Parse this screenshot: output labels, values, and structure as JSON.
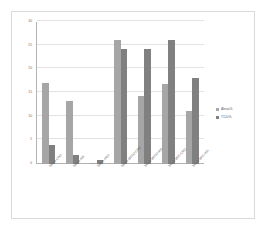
{
  "chart_data": {
    "type": "bar",
    "title": "",
    "xlabel": "",
    "ylabel": "",
    "ylim": [
      0,
      30
    ],
    "yticks": [
      0,
      5,
      10,
      15,
      20,
      25,
      30
    ],
    "grid": true,
    "legend_position": "right",
    "categories": [
      "SMLO-CRO",
      "SMLO-RSI",
      "SMLO-PRO",
      "SMLO-MECO-CRO",
      "SMLO-MECO-RSI",
      "SMLO-MEC-CRO",
      "SMLO-MEC-RSI"
    ],
    "series": [
      {
        "name": "Alexa%",
        "color": "#a6a6a6",
        "values": [
          17.2,
          13.3,
          0.3,
          26.2,
          14.3,
          17.0,
          11.3
        ]
      },
      {
        "name": "T12v%",
        "color": "#808080",
        "values": [
          4.0,
          2.0,
          0.8,
          24.3,
          24.3,
          26.3,
          18.1
        ]
      }
    ]
  },
  "legend": {
    "items": [
      {
        "label": "Alexa%"
      },
      {
        "label": "T12v%"
      }
    ]
  }
}
